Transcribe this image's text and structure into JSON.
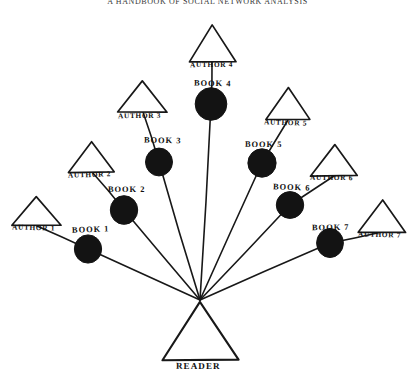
{
  "header": {
    "title": "A HANDBOOK OF SOCIAL NETWORK ANALYSIS"
  },
  "diagram": {
    "kind": "hand-drawn-network-diagram",
    "center_label": "READER",
    "center_point": {
      "x": 200,
      "y": 300
    },
    "colors": {
      "ink": "#181818",
      "node_fill": "#131313",
      "background": "#ffffff"
    },
    "authors": [
      {
        "id": "author-1",
        "label": "AUTHOR 1",
        "apex_x": 37,
        "apex_y": 196,
        "half_width": 24,
        "height": 30,
        "label_x": 12,
        "label_y": 223
      },
      {
        "id": "author-2",
        "label": "AUTHOR 2",
        "apex_x": 92,
        "apex_y": 142,
        "half_width": 23,
        "height": 30,
        "label_x": 68,
        "label_y": 170
      },
      {
        "id": "author-3",
        "label": "AUTHOR 3",
        "apex_x": 143,
        "apex_y": 80,
        "half_width": 25,
        "height": 32,
        "label_x": 118,
        "label_y": 111
      },
      {
        "id": "author-4",
        "label": "AUTHOR 4",
        "apex_x": 212,
        "apex_y": 25,
        "half_width": 23,
        "height": 37,
        "label_x": 190,
        "label_y": 60
      },
      {
        "id": "author-5",
        "label": "AUTHOR 5",
        "apex_x": 288,
        "apex_y": 88,
        "half_width": 23,
        "height": 32,
        "label_x": 264,
        "label_y": 118
      },
      {
        "id": "author-6",
        "label": "AUTHOR 6",
        "apex_x": 334,
        "apex_y": 144,
        "half_width": 23,
        "height": 32,
        "label_x": 310,
        "label_y": 173
      },
      {
        "id": "author-7",
        "label": "AUTHOR 7",
        "apex_x": 382,
        "apex_y": 200,
        "half_width": 24,
        "height": 32,
        "label_x": 358,
        "label_y": 230
      }
    ],
    "books": [
      {
        "id": "book-1",
        "label": "BOOK 1",
        "cx": 88,
        "cy": 249,
        "r": 14,
        "label_x": 72,
        "label_y": 225
      },
      {
        "id": "book-2",
        "label": "BOOK 2",
        "cx": 124,
        "cy": 210,
        "r": 14,
        "label_x": 108,
        "label_y": 185
      },
      {
        "id": "book-3",
        "label": "BOOK 3",
        "cx": 159,
        "cy": 162,
        "r": 14,
        "label_x": 144,
        "label_y": 136
      },
      {
        "id": "book-4",
        "label": "BOOK 4",
        "cx": 211,
        "cy": 104,
        "r": 16,
        "label_x": 194,
        "label_y": 79
      },
      {
        "id": "book-5",
        "label": "BOOK 5",
        "cx": 262,
        "cy": 163,
        "r": 14,
        "label_x": 245,
        "label_y": 140
      },
      {
        "id": "book-6",
        "label": "BOOK 6",
        "cx": 290,
        "cy": 205,
        "r": 14,
        "label_x": 273,
        "label_y": 183
      },
      {
        "id": "book-7",
        "label": "BOOK 7",
        "cx": 330,
        "cy": 243,
        "r": 14,
        "label_x": 312,
        "label_y": 223
      }
    ],
    "reader": {
      "id": "reader",
      "label": "READER",
      "apex_x": 200,
      "apex_y": 301,
      "half_width": 38,
      "height": 59,
      "label_x": 176,
      "label_y": 361
    },
    "edges_author_to_book": [
      {
        "from": "author-1",
        "to": "book-1"
      },
      {
        "from": "author-2",
        "to": "book-2"
      },
      {
        "from": "author-3",
        "to": "book-3"
      },
      {
        "from": "author-4",
        "to": "book-4"
      },
      {
        "from": "author-5",
        "to": "book-5"
      },
      {
        "from": "author-6",
        "to": "book-6"
      },
      {
        "from": "author-7",
        "to": "book-7"
      }
    ],
    "edges_book_to_reader": [
      {
        "from": "book-1",
        "to": "reader"
      },
      {
        "from": "book-2",
        "to": "reader"
      },
      {
        "from": "book-3",
        "to": "reader"
      },
      {
        "from": "book-4",
        "to": "reader"
      },
      {
        "from": "book-5",
        "to": "reader"
      },
      {
        "from": "book-6",
        "to": "reader"
      },
      {
        "from": "book-7",
        "to": "reader"
      }
    ]
  }
}
